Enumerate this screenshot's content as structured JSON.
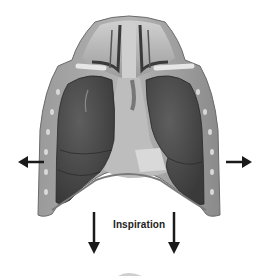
{
  "figure": {
    "label": "Inspiration",
    "arrows": [
      {
        "direction": "left",
        "meaning": "lateral expansion"
      },
      {
        "direction": "right",
        "meaning": "lateral expansion"
      },
      {
        "direction": "down",
        "meaning": "diaphragm descends"
      },
      {
        "direction": "down",
        "meaning": "diaphragm descends"
      }
    ],
    "colors": {
      "background": "#ffffff",
      "lung": "#4a4a4a",
      "chest_wall": "#8c8c8c",
      "arrow": "#1a1a1a",
      "mediastinum": "#bdbdbd"
    }
  }
}
